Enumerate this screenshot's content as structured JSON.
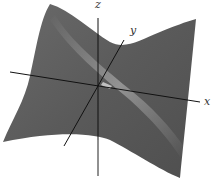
{
  "figure": {
    "type": "3d-surface",
    "surface_color": "#5f5f5f",
    "highlight_color": "#bdbdbd",
    "axis_color": "#111111"
  },
  "axes": {
    "x_label": "x",
    "y_label": "y",
    "z_label": "z"
  }
}
